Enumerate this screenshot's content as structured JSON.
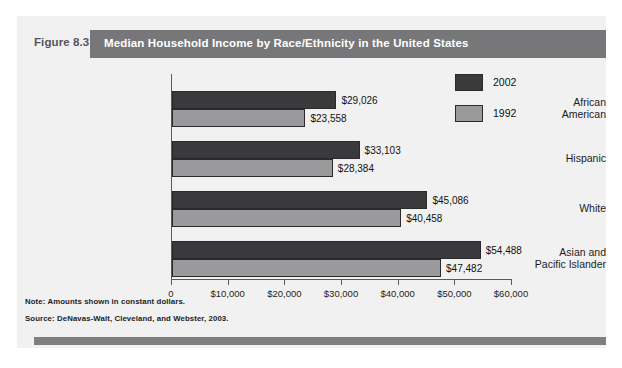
{
  "figure": {
    "number": "Figure 8.3",
    "title": "Median Household Income by Race/Ethnicity in the United States",
    "note": "Note: Amounts shown in constant dollars.",
    "source": "Source: DeNavas-Walt, Cleveland, and Webster, 2003."
  },
  "colors": {
    "panel_background": "#f1f1f1",
    "title_bar": "#77777a",
    "series_2002": "#3a3a3c",
    "series_1992": "#9a9a9c",
    "axis": "#5a5a5a",
    "bottom_rule": "#808083"
  },
  "chart_data": {
    "type": "bar",
    "orientation": "horizontal",
    "title": "Median Household Income by Race/Ethnicity in the United States",
    "xlabel": "",
    "ylabel": "",
    "xlim": [
      0,
      60000
    ],
    "grid": false,
    "legend_position": "top-right",
    "categories": [
      "African American",
      "Hispanic",
      "White",
      "Asian and Pacific Islander"
    ],
    "category_lines": [
      [
        "African",
        "American"
      ],
      [
        "Hispanic"
      ],
      [
        "White"
      ],
      [
        "Asian and",
        "Pacific Islander"
      ]
    ],
    "tick_values": [
      0,
      10000,
      20000,
      30000,
      40000,
      50000,
      60000
    ],
    "tick_labels": [
      "0",
      "$10,000",
      "$20,000",
      "$30,000",
      "$40,000",
      "$50,000",
      "$60,000"
    ],
    "series": [
      {
        "name": "2002",
        "color": "#3a3a3c",
        "values": [
          29026,
          33103,
          45086,
          54488
        ],
        "labels": [
          "$29,026",
          "$33,103",
          "$45,086",
          "$54,488"
        ]
      },
      {
        "name": "1992",
        "color": "#9a9a9c",
        "values": [
          23558,
          28384,
          40458,
          47482
        ],
        "labels": [
          "$23,558",
          "$28,384",
          "$40,458",
          "$47,482"
        ]
      }
    ]
  }
}
